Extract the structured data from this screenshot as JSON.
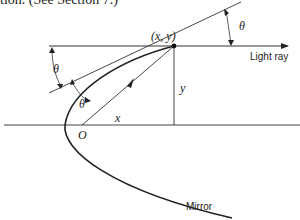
{
  "caption": "tion. (See Section 7.)",
  "labels": {
    "point": "(x, y)",
    "light_ray": "Light ray",
    "mirror": "Mirror",
    "origin": "O",
    "x": "x",
    "y": "y",
    "theta_right": "θ",
    "theta_left": "θ",
    "theta_inner": "θ"
  },
  "colors": {
    "stroke": "#222222",
    "background": "#ffffff"
  }
}
